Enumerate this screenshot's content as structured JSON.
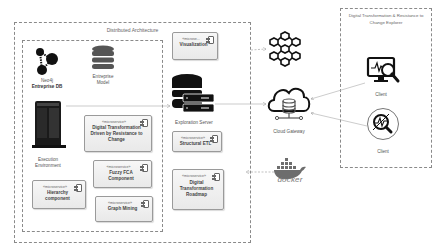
{
  "diagram": {
    "distributed_architecture": {
      "title": "Distributed Architecture"
    },
    "explorer": {
      "title_line1": "Digital Transformation & Resistance to",
      "title_line2": "Change Explorer",
      "clients": [
        {
          "label": "Client",
          "icon": "monitor-magnifier-icon"
        },
        {
          "label": "Client",
          "icon": "circle-analysis-icon"
        }
      ]
    },
    "nodes": {
      "neo4j": {
        "line1": "Neo4j",
        "line2": "Entreprise DB",
        "icon": "graph-nodes-icon"
      },
      "enterprise_model": {
        "line1": "Entreprise",
        "line2": "Model",
        "icon": "database-icon"
      },
      "execution_env": {
        "line1": "Execution",
        "line2": "Environment",
        "icon": "server-tower-icon"
      },
      "exploration_server": {
        "label": "Exploration Server",
        "icon": "database-server-icon"
      },
      "cloud_gateway": {
        "label": "Cloud Gateway",
        "icon": "cloud-database-icon"
      },
      "blockchain": {
        "icon": "cube-network-icon"
      },
      "docker": {
        "label": "docker",
        "icon": "docker-whale-icon"
      }
    },
    "microservices": [
      {
        "stereotype": "«microse...",
        "name": "Visualization"
      },
      {
        "stereotype": "«microservice»",
        "name": "Digital Transformation Driven by Resistance to Change"
      },
      {
        "stereotype": "«microservice»",
        "name": "Fuzzy FCA Component"
      },
      {
        "stereotype": "«microservice»",
        "name": "Hierarchy component"
      },
      {
        "stereotype": "«microservice»",
        "name": "Graph Mining"
      },
      {
        "stereotype": "«microservice»",
        "name": "Structural ETL"
      },
      {
        "stereotype": "«microservice»",
        "name": "Digital Transformation Roadmap"
      }
    ]
  }
}
